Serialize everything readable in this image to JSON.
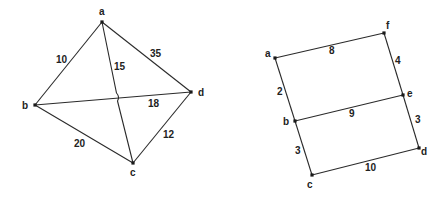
{
  "graphs": [
    {
      "name": "left-graph",
      "nodes": [
        {
          "id": "a",
          "x": 102,
          "y": 22,
          "lx": 99,
          "ly": 15
        },
        {
          "id": "b",
          "x": 35,
          "y": 105,
          "lx": 22,
          "ly": 109
        },
        {
          "id": "c",
          "x": 133,
          "y": 163,
          "lx": 130,
          "ly": 176
        },
        {
          "id": "d",
          "x": 191,
          "y": 92,
          "lx": 198,
          "ly": 96
        }
      ],
      "edges": [
        {
          "from": "a",
          "to": "b",
          "weight": "10",
          "lx": 56,
          "ly": 63
        },
        {
          "from": "a",
          "to": "d",
          "weight": "35",
          "lx": 150,
          "ly": 57
        },
        {
          "from": "a",
          "to": "c",
          "weight": "15",
          "lx": 114,
          "ly": 70
        },
        {
          "from": "b",
          "to": "d",
          "weight": "18",
          "lx": 148,
          "ly": 107
        },
        {
          "from": "b",
          "to": "c",
          "weight": "20",
          "lx": 74,
          "ly": 147
        },
        {
          "from": "c",
          "to": "d",
          "weight": "12",
          "lx": 163,
          "ly": 138
        }
      ]
    },
    {
      "name": "right-graph",
      "nodes": [
        {
          "id": "a",
          "x": 275,
          "y": 58,
          "lx": 265,
          "ly": 57
        },
        {
          "id": "f",
          "x": 384,
          "y": 33,
          "lx": 386,
          "ly": 29
        },
        {
          "id": "e",
          "x": 403,
          "y": 95,
          "lx": 407,
          "ly": 97
        },
        {
          "id": "b",
          "x": 295,
          "y": 121,
          "lx": 283,
          "ly": 125
        },
        {
          "id": "d",
          "x": 419,
          "y": 148,
          "lx": 421,
          "ly": 155
        },
        {
          "id": "c",
          "x": 312,
          "y": 175,
          "lx": 307,
          "ly": 188
        }
      ],
      "edges": [
        {
          "from": "a",
          "to": "f",
          "weight": "8",
          "lx": 329,
          "ly": 54
        },
        {
          "from": "f",
          "to": "e",
          "weight": "4",
          "lx": 395,
          "ly": 64
        },
        {
          "from": "a",
          "to": "b",
          "weight": "2",
          "lx": 277,
          "ly": 95
        },
        {
          "from": "b",
          "to": "e",
          "weight": "9",
          "lx": 349,
          "ly": 117
        },
        {
          "from": "e",
          "to": "d",
          "weight": "3",
          "lx": 415,
          "ly": 123
        },
        {
          "from": "b",
          "to": "c",
          "weight": "3",
          "lx": 295,
          "ly": 154
        },
        {
          "from": "c",
          "to": "d",
          "weight": "10",
          "lx": 365,
          "ly": 171
        }
      ]
    }
  ]
}
